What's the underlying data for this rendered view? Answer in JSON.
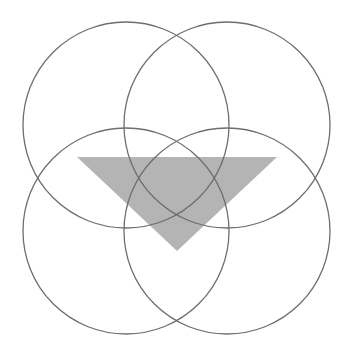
{
  "diagram": {
    "colors": {
      "background": "#ffffff",
      "circle_stroke": "#6e6e6e",
      "triangle_fill": "#b4b4b4"
    },
    "circles": [
      {
        "name": "top-left",
        "cx": 126,
        "cy": 125,
        "r": 103
      },
      {
        "name": "top-right",
        "cx": 227,
        "cy": 125,
        "r": 103
      },
      {
        "name": "bottom-left",
        "cx": 126,
        "cy": 231,
        "r": 103
      },
      {
        "name": "bottom-right",
        "cx": 227,
        "cy": 231,
        "r": 103
      }
    ],
    "triangle": {
      "points": [
        [
          77,
          157
        ],
        [
          277,
          157
        ],
        [
          177,
          251
        ]
      ]
    }
  }
}
